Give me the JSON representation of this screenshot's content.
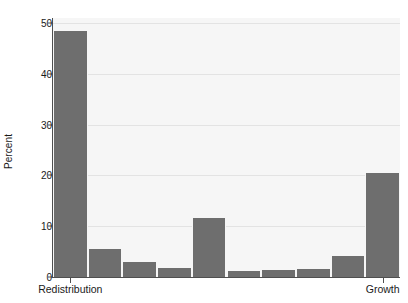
{
  "chart_data": {
    "type": "bar",
    "title": "",
    "subtitle": "",
    "xlabel": "",
    "ylabel": "Percent",
    "ylim": [
      0,
      51
    ],
    "yticks": [
      0,
      10,
      20,
      30,
      40,
      50
    ],
    "ytick_labels": [
      "0",
      "10",
      "20",
      "30",
      "40",
      "50"
    ],
    "grid": "horizontal",
    "legend": "none",
    "bar_color": "#6e6e6e",
    "plot_background": "#f6f6f6",
    "gridline_color": "#e3e3e3",
    "axis_color": "#4f4f4f",
    "categories": [
      "1",
      "2",
      "3",
      "4",
      "5",
      "6",
      "7",
      "8",
      "9",
      "10"
    ],
    "values": [
      48.5,
      5.5,
      3.0,
      1.8,
      11.6,
      1.2,
      1.3,
      1.5,
      4.2,
      20.4
    ],
    "xtick_positions": [
      1,
      10
    ],
    "xtick_labels": [
      "Redistribution",
      "Growth"
    ],
    "annotations": []
  },
  "axis": {
    "y_title": "Percent",
    "x_left_label": "Redistribution",
    "x_right_label": "Growth"
  },
  "caption": {
    "clipped_line": ""
  }
}
